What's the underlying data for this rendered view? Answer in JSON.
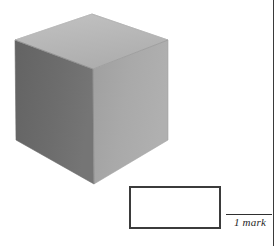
{
  "page": {
    "width": 278,
    "height": 246,
    "background_color": "#ffffff",
    "edge_rule_color": "#3a3a3a"
  },
  "figure": {
    "name": "cube",
    "faces": [
      {
        "id": "top",
        "label": "top face",
        "fill": "#b8b8b8",
        "points": "15,40 92,14 168,40 93,69"
      },
      {
        "id": "left",
        "label": "left face",
        "fill": "#6a6a6a",
        "points": "15,40 93,69 94,184 16,140"
      },
      {
        "id": "right",
        "label": "right face",
        "fill": "#a8a8a8",
        "points": "93,69 168,40 168,140 94,184"
      }
    ],
    "edge_color": "#8f8f8f"
  },
  "answer_box": {
    "label": "",
    "value": "",
    "placeholder": "",
    "border_color": "#3b3b3b",
    "fill_color": "#ffffff"
  },
  "marks": {
    "label": "1 mark",
    "count": 1,
    "rule_color": "#2f2f2f"
  }
}
